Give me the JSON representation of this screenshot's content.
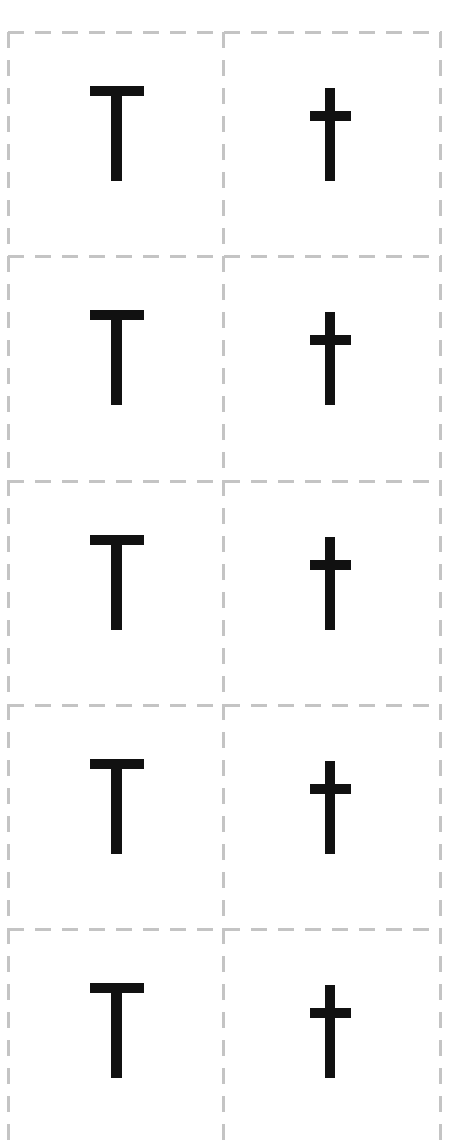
{
  "worksheet": {
    "columns": [
      "uppercase",
      "lowercase"
    ],
    "rows": [
      {
        "uppercase": "T",
        "lowercase": "t"
      },
      {
        "uppercase": "T",
        "lowercase": "t"
      },
      {
        "uppercase": "T",
        "lowercase": "t"
      },
      {
        "uppercase": "T",
        "lowercase": "t"
      },
      {
        "uppercase": "T",
        "lowercase": "t"
      }
    ]
  },
  "colors": {
    "glyph": "#111111",
    "dashed_line": "#c4c4c4",
    "background": "#ffffff"
  }
}
